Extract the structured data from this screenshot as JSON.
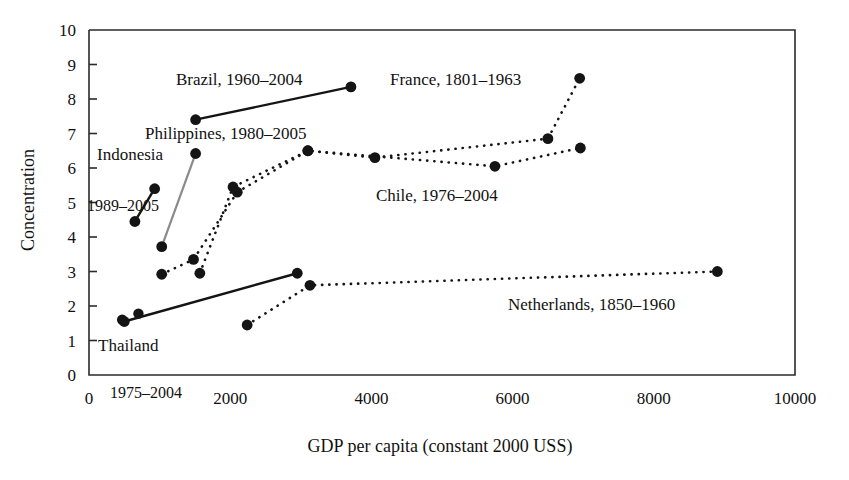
{
  "chart_data": {
    "type": "scatter",
    "title": "",
    "xlabel": "GDP per capita (constant 2000 USS)",
    "ylabel": "Concentration",
    "xlim": [
      0,
      10000
    ],
    "ylim": [
      0,
      10
    ],
    "xticks": [
      0,
      2000,
      4000,
      6000,
      8000,
      10000
    ],
    "xtick_labels": [
      "0",
      "2000",
      "4000",
      "6000",
      "8000",
      "10000"
    ],
    "yticks": [
      0,
      1,
      2,
      3,
      4,
      5,
      6,
      7,
      8,
      9,
      10
    ],
    "ytick_labels": [
      "0",
      "1",
      "2",
      "3",
      "4",
      "5",
      "6",
      "7",
      "8",
      "9",
      "10"
    ],
    "grid": false,
    "legend": "inline-annotations",
    "series": [
      {
        "name": "Brazil, 1960-2004",
        "label": "Brazil, 1960–2004",
        "style": "solid",
        "color": "#141414",
        "points": [
          {
            "x": 1510,
            "y": 7.4
          },
          {
            "x": 3710,
            "y": 8.35
          }
        ]
      },
      {
        "name": "France, 1801-1963",
        "label": "France, 1801–1963",
        "style": "dotted",
        "color": "#141414",
        "points": [
          {
            "x": 1570,
            "y": 2.95
          },
          {
            "x": 2040,
            "y": 5.45
          },
          {
            "x": 3100,
            "y": 6.5
          },
          {
            "x": 4050,
            "y": 6.3
          },
          {
            "x": 6500,
            "y": 6.85
          },
          {
            "x": 6950,
            "y": 8.6
          }
        ]
      },
      {
        "name": "Philippines, 1980-2005",
        "label": "Philippines, 1980–2005",
        "style": "solid-gray",
        "color": "#8a8a8a",
        "points": [
          {
            "x": 1030,
            "y": 3.72
          },
          {
            "x": 1510,
            "y": 6.42
          }
        ]
      },
      {
        "name": "Indonesia, 1989-2005",
        "label": "Indonesia",
        "range_label": "1989–2005",
        "style": "solid",
        "color": "#141414",
        "points": [
          {
            "x": 650,
            "y": 4.45
          },
          {
            "x": 930,
            "y": 5.4
          }
        ]
      },
      {
        "name": "Chile, 1976-2004",
        "label": "Chile, 1976–2004",
        "style": "dotted",
        "color": "#141414",
        "points": [
          {
            "x": 1030,
            "y": 2.92
          },
          {
            "x": 1480,
            "y": 3.35
          },
          {
            "x": 2100,
            "y": 5.3
          },
          {
            "x": 3100,
            "y": 6.5
          },
          {
            "x": 5750,
            "y": 6.05
          },
          {
            "x": 6960,
            "y": 6.58
          }
        ]
      },
      {
        "name": "Netherlands, 1850-1960",
        "label": "Netherlands, 1850–1960",
        "style": "dotted",
        "color": "#141414",
        "points": [
          {
            "x": 2240,
            "y": 1.45
          },
          {
            "x": 3130,
            "y": 2.6
          },
          {
            "x": 8900,
            "y": 3.0
          }
        ]
      },
      {
        "name": "Thailand, 1975-2004",
        "label": "Thailand",
        "range_label": "1975–2004",
        "style": "solid",
        "color": "#141414",
        "points": [
          {
            "x": 500,
            "y": 1.55
          },
          {
            "x": 2950,
            "y": 2.95
          }
        ]
      }
    ],
    "extra_points": [
      {
        "x": 470,
        "y": 1.6
      },
      {
        "x": 700,
        "y": 1.78
      }
    ]
  },
  "annotations": {
    "brazil": "Brazil, 1960–2004",
    "france": "France, 1801–1963",
    "philippines": "Philippines, 1980–2005",
    "indonesia": "Indonesia",
    "indonesia_years": "1989–2005",
    "chile": "Chile, 1976–2004",
    "netherlands": "Netherlands, 1850–1960",
    "thailand": "Thailand",
    "thailand_years": "1975–2004"
  },
  "axes": {
    "y_title": "Concentration",
    "x_title": "GDP per capita (constant 2000 USS)"
  }
}
